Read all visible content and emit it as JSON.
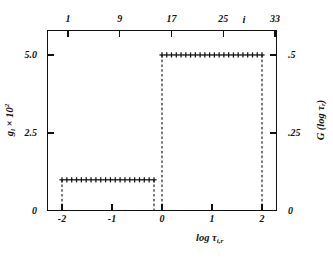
{
  "axes": {
    "top": {
      "title": "i",
      "ticks": [
        {
          "label": "1",
          "i": 1
        },
        {
          "label": "9",
          "i": 9
        },
        {
          "label": "17",
          "i": 17
        },
        {
          "label": "25",
          "i": 25
        },
        {
          "label": "33",
          "i": 33
        }
      ]
    },
    "bottom": {
      "title_main": "log ",
      "title_sym": "τ",
      "title_sub": "i,r",
      "ticks": [
        {
          "label": "-2",
          "x": -2
        },
        {
          "label": "-1",
          "x": -1
        },
        {
          "label": "0",
          "x": 0
        },
        {
          "label": "1",
          "x": 1
        },
        {
          "label": "2",
          "x": 2
        }
      ]
    },
    "left": {
      "title_main": "g",
      "title_sub": "i",
      "title_tail": " × 10",
      "title_sup": "2",
      "ticks": [
        {
          "label": "0",
          "y": 0
        },
        {
          "label": "2.5",
          "y": 2.5
        },
        {
          "label": "5.0",
          "y": 5.0
        }
      ]
    },
    "right": {
      "title": "G (log τ",
      "title_sub": "r",
      "title_tail": ")",
      "ticks": [
        {
          "label": "0",
          "y": 0
        },
        {
          "label": ".25",
          "y": 0.25
        },
        {
          "label": ".5",
          "y": 0.5
        }
      ]
    }
  },
  "chart_data": {
    "type": "line",
    "title": "",
    "xlabel": "log τ_i,r",
    "ylabel": "g_i × 10²",
    "ylabel_right": "G (log τ_r)",
    "xlim": [
      -2.3,
      2.3
    ],
    "ylim": [
      0,
      5.8
    ],
    "ylim_right": [
      0,
      0.58
    ],
    "grid": false,
    "legend": null,
    "marker": "+",
    "step_style": "dashed-vertical-risers",
    "series": [
      {
        "name": "lower-plateau",
        "level": 1.0,
        "level_right": 0.1,
        "x_start": -2.0,
        "x_end": -0.16,
        "n_markers": 20,
        "x": [
          -2.0,
          -1.903,
          -1.806,
          -1.709,
          -1.612,
          -1.516,
          -1.419,
          -1.322,
          -1.225,
          -1.128,
          -1.031,
          -0.935,
          -0.838,
          -0.741,
          -0.644,
          -0.547,
          -0.45,
          -0.354,
          -0.257,
          -0.16
        ],
        "y": [
          1.0,
          1.0,
          1.0,
          1.0,
          1.0,
          1.0,
          1.0,
          1.0,
          1.0,
          1.0,
          1.0,
          1.0,
          1.0,
          1.0,
          1.0,
          1.0,
          1.0,
          1.0,
          1.0,
          1.0
        ]
      },
      {
        "name": "upper-plateau",
        "level": 5.0,
        "level_right": 0.5,
        "x_start": 0.0,
        "x_end": 2.0,
        "n_markers": 22,
        "x": [
          0.0,
          0.095,
          0.19,
          0.286,
          0.381,
          0.476,
          0.571,
          0.667,
          0.762,
          0.857,
          0.952,
          1.048,
          1.143,
          1.238,
          1.333,
          1.429,
          1.524,
          1.619,
          1.714,
          1.81,
          1.905,
          2.0
        ],
        "y": [
          5.0,
          5.0,
          5.0,
          5.0,
          5.0,
          5.0,
          5.0,
          5.0,
          5.0,
          5.0,
          5.0,
          5.0,
          5.0,
          5.0,
          5.0,
          5.0,
          5.0,
          5.0,
          5.0,
          5.0,
          5.0,
          5.0
        ]
      }
    ],
    "risers": [
      {
        "name": "riser-left-start",
        "x": -2.0,
        "y0": 0.0,
        "y1": 1.0
      },
      {
        "name": "riser-left-end",
        "x": -0.16,
        "y0": 0.0,
        "y1": 1.0
      },
      {
        "name": "riser-right-start",
        "x": 0.0,
        "y0": 0.0,
        "y1": 5.0
      },
      {
        "name": "riser-right-end",
        "x": 2.0,
        "y0": 0.0,
        "y1": 5.0
      }
    ]
  }
}
